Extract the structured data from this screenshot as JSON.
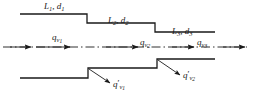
{
  "figure": {
    "type": "engineering-diagram",
    "background_color": "#ffffff",
    "line_color": "#1a1a1a",
    "dimensions": {
      "width": 253,
      "height": 101
    }
  },
  "dimension_labels": [
    {
      "id": "section-1",
      "text": "L",
      "sub": "1",
      "text2": "d",
      "sub2": "1",
      "separator": ", "
    },
    {
      "id": "section-2",
      "text": "L",
      "sub": "2",
      "text2": "d",
      "sub2": "2",
      "separator": ", "
    },
    {
      "id": "section-3",
      "text": "L",
      "sub": "3",
      "text2": "d",
      "sub2": "3",
      "separator": ", "
    }
  ],
  "flow_labels": [
    {
      "id": "flow-1",
      "symbol": "q",
      "sub": "v",
      "subsub": "1",
      "prime": ""
    },
    {
      "id": "flow-2",
      "symbol": "q",
      "sub": "v",
      "subsub": "2",
      "prime": ""
    },
    {
      "id": "flow-3",
      "symbol": "q",
      "sub": "v",
      "subsub": "3",
      "prime": ""
    }
  ],
  "branch_labels": [
    {
      "id": "branch-1",
      "symbol": "q",
      "prime": "′",
      "sub": "v",
      "subsub": "1"
    },
    {
      "id": "branch-2",
      "symbol": "q",
      "prime": "′",
      "sub": "v",
      "subsub": "2"
    }
  ],
  "geometry": {
    "upper_wall_points": "20,14 87,14 87,23 155,23 155,32 215,32",
    "lower_wall_points": "20,78 88,78 88,68 157,68 157,59 215,59",
    "centerline": {
      "y": 47,
      "x_start": 3,
      "x_end": 247,
      "style": "dash-dot"
    },
    "step_x_positions": [
      87,
      155
    ],
    "pipe_left_x": 20,
    "pipe_right_x": 215
  },
  "arrows": {
    "inlet": {
      "x1": 10,
      "y1": 47,
      "x2": 33,
      "y2": 47
    },
    "outlet": {
      "x1": 222,
      "y1": 47,
      "x2": 246,
      "y2": 47
    },
    "flow_1": {
      "x1": 36,
      "y1": 47,
      "x2": 72,
      "y2": 47
    },
    "flow_2": {
      "x1": 106,
      "y1": 47,
      "x2": 140,
      "y2": 47
    },
    "flow_3": {
      "x1": 172,
      "y1": 47,
      "x2": 196,
      "y2": 47
    },
    "branch_1": {
      "x1": 88,
      "y1": 69,
      "x2": 112,
      "y2": 84
    },
    "branch_2": {
      "x1": 157,
      "y1": 60,
      "x2": 182,
      "y2": 76
    }
  }
}
